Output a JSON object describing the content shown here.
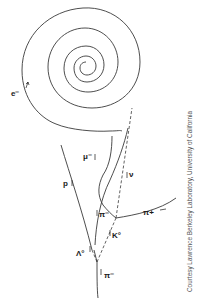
{
  "diagram": {
    "labels": {
      "electron": "e⁻",
      "muon": "μ⁻",
      "proton": "p",
      "neutrino": "ν",
      "pion_minus_upper": "π⁻",
      "pion_plus": "π+",
      "kaon": "K°",
      "lambda": "Λ°",
      "pion_minus_lower": "π⁻"
    },
    "line_styles": {
      "charged_track": "solid",
      "neutral_track": "dashed"
    },
    "colors": {
      "track": "#3a3a3a",
      "background": "#ffffff",
      "credit": "#555555"
    }
  },
  "credit": "Courtesy Lawrence Berkeley Laboratory, University of California"
}
